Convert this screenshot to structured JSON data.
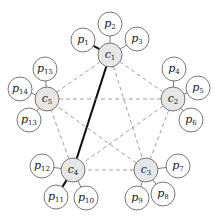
{
  "diagram": {
    "title": "",
    "colors": {
      "center_fill": "#e6e6e6",
      "peer_fill": "#ffffff",
      "stroke": "#555555",
      "dashed": "#888888",
      "bold": "#111111"
    },
    "centers": [
      {
        "id": "c1",
        "base": "c",
        "sub": "1",
        "x": 110,
        "y": 55
      },
      {
        "id": "c2",
        "base": "c",
        "sub": "2",
        "x": 173,
        "y": 99
      },
      {
        "id": "c3",
        "base": "c",
        "sub": "3",
        "x": 146,
        "y": 170
      },
      {
        "id": "c4",
        "base": "c",
        "sub": "4",
        "x": 73,
        "y": 170
      },
      {
        "id": "c5",
        "base": "c",
        "sub": "5",
        "x": 47,
        "y": 99
      }
    ],
    "peers": [
      {
        "id": "p1",
        "base": "p",
        "sub": "1",
        "x": 83,
        "y": 40,
        "center": "c1",
        "bold": true
      },
      {
        "id": "p2",
        "base": "p",
        "sub": "2",
        "x": 110,
        "y": 24,
        "center": "c1",
        "bold": false
      },
      {
        "id": "p3",
        "base": "p",
        "sub": "3",
        "x": 137,
        "y": 39,
        "center": "c1",
        "bold": false
      },
      {
        "id": "p4",
        "base": "p",
        "sub": "4",
        "x": 174,
        "y": 69,
        "center": "c2",
        "bold": false
      },
      {
        "id": "p5",
        "base": "p",
        "sub": "5",
        "x": 198,
        "y": 88,
        "center": "c2",
        "bold": false
      },
      {
        "id": "p6",
        "base": "p",
        "sub": "6",
        "x": 191,
        "y": 120,
        "center": "c2",
        "bold": false
      },
      {
        "id": "p7",
        "base": "p",
        "sub": "7",
        "x": 178,
        "y": 166,
        "center": "c3",
        "bold": false
      },
      {
        "id": "p8",
        "base": "p",
        "sub": "8",
        "x": 163,
        "y": 194,
        "center": "c3",
        "bold": false
      },
      {
        "id": "p9",
        "base": "p",
        "sub": "9",
        "x": 137,
        "y": 198,
        "center": "c3",
        "bold": false
      },
      {
        "id": "p10",
        "base": "p",
        "sub": "10",
        "x": 86,
        "y": 198,
        "center": "c4",
        "bold": false
      },
      {
        "id": "p11",
        "base": "p",
        "sub": "11",
        "x": 56,
        "y": 197,
        "center": "c4",
        "bold": true
      },
      {
        "id": "p12",
        "base": "p",
        "sub": "12",
        "x": 42,
        "y": 166,
        "center": "c4",
        "bold": false
      },
      {
        "id": "p13",
        "base": "p",
        "sub": "13",
        "x": 29,
        "y": 120,
        "center": "c5",
        "bold": false
      },
      {
        "id": "p14",
        "base": "p",
        "sub": "14",
        "x": 20,
        "y": 89,
        "center": "c5",
        "bold": false
      },
      {
        "id": "p15",
        "base": "p",
        "sub": "15",
        "x": 45,
        "y": 69,
        "center": "c5",
        "bold": false
      }
    ],
    "center_edges": [
      {
        "from": "c1",
        "to": "c2",
        "bold": false
      },
      {
        "from": "c1",
        "to": "c3",
        "bold": false
      },
      {
        "from": "c1",
        "to": "c4",
        "bold": true
      },
      {
        "from": "c1",
        "to": "c5",
        "bold": false
      },
      {
        "from": "c2",
        "to": "c3",
        "bold": false
      },
      {
        "from": "c2",
        "to": "c4",
        "bold": false
      },
      {
        "from": "c2",
        "to": "c5",
        "bold": false
      },
      {
        "from": "c3",
        "to": "c4",
        "bold": false
      },
      {
        "from": "c3",
        "to": "c5",
        "bold": false
      },
      {
        "from": "c4",
        "to": "c5",
        "bold": false
      }
    ],
    "center_radius": 12,
    "peer_radius": 12
  }
}
